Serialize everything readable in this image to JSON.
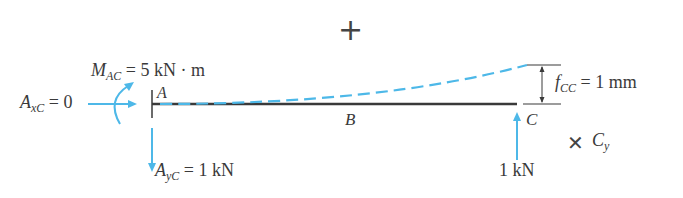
{
  "diagram": {
    "sign": "+",
    "moment": {
      "symbol": "M",
      "sub": "AC",
      "value": " = 5 kN · m"
    },
    "horizontal_reaction": {
      "symbol": "A",
      "sub": "xC",
      "value": " = 0"
    },
    "vertical_reaction": {
      "symbol": "A",
      "sub": "yC",
      "value": " = 1 kN"
    },
    "points": {
      "a": "A",
      "b": "B",
      "c": "C"
    },
    "deflection": {
      "symbol": "f",
      "sub": "CC",
      "value": " = 1 mm"
    },
    "applied_load": "1 kN",
    "released_reaction": {
      "mark": "✕",
      "symbol": "C",
      "sub": "y"
    },
    "colors": {
      "beam": "#3a3a3a",
      "accent": "#4db8e8",
      "text": "#3a3a3a"
    }
  }
}
